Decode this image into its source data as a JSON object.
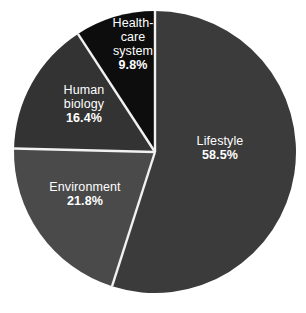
{
  "chart_data": {
    "type": "pie",
    "title": "",
    "subtitle": "",
    "xlabel": "",
    "ylabel": "",
    "legend_position": "none",
    "grid": false,
    "units": "%",
    "start_angle_deg": 0,
    "direction": "clockwise",
    "categories": [
      "Lifestyle",
      "Environment",
      "Human biology",
      "Health-care system"
    ],
    "values": [
      58.5,
      21.8,
      16.4,
      9.8
    ],
    "slices": [
      {
        "label": "Lifestyle",
        "label_lines": [
          "Lifestyle"
        ],
        "value": 58.5,
        "value_text": "58.5%",
        "color": "#3b3b3b",
        "start_deg": 0,
        "end_deg": 210.6
      },
      {
        "label": "Environment",
        "label_lines": [
          "Environment"
        ],
        "value": 21.8,
        "value_text": "21.8%",
        "color": "#4a4a4a",
        "start_deg": 210.6,
        "end_deg": 289.08
      },
      {
        "label": "Human biology",
        "label_lines": [
          "Human",
          "biology"
        ],
        "value": 16.4,
        "value_text": "16.4%",
        "color": "#333333",
        "start_deg": 289.08,
        "end_deg": 348.12
      },
      {
        "label": "Health-care system",
        "label_lines": [
          "Health-",
          "care",
          "system"
        ],
        "value": 9.8,
        "value_text": "9.8%",
        "color": "#0d0d0d",
        "start_deg": 348.12,
        "end_deg": 360
      }
    ]
  },
  "chart": {
    "background_color": "#ffffff",
    "divider_color": "#f2f2f2",
    "label_text_color": "#ffffff",
    "center_x": 155,
    "center_y": 152,
    "radius": 141
  },
  "labels": {
    "healthcare": {
      "line1": "Health-",
      "line2": "care",
      "line3": "system",
      "value": "9.8%"
    },
    "lifestyle": {
      "line1": "Lifestyle",
      "value": "58.5%"
    },
    "human_biology": {
      "line1": "Human",
      "line2": "biology",
      "value": "16.4%"
    },
    "environment": {
      "line1": "Environment",
      "value": "21.8%"
    }
  }
}
